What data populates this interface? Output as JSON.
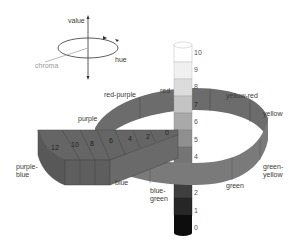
{
  "axes_legend": {
    "value_label": "value",
    "hue_label": "hue",
    "chroma_label": "chroma"
  },
  "hues": [
    {
      "label": "red-purple"
    },
    {
      "label": "red"
    },
    {
      "label": "yellow-red"
    },
    {
      "label": "yellow"
    },
    {
      "label": "green-yellow"
    },
    {
      "label": "green"
    },
    {
      "label": "blue-green"
    },
    {
      "label": "blue"
    },
    {
      "label": "purple-blue"
    },
    {
      "label": "purple"
    }
  ],
  "value_scale": [
    "10",
    "9",
    "8",
    "7",
    "6",
    "5",
    "4",
    "2",
    "1",
    "0"
  ],
  "chroma_scale": [
    "12",
    "10",
    "8",
    "6",
    "4",
    "2",
    "0"
  ],
  "colors": {
    "ring": "#6e6e6e",
    "ring_top": "#7d7d7d",
    "wedge_top": "#656565",
    "wedge_side": "#595959",
    "value_10": "#ffffff",
    "value_9": "#f2f2f2",
    "value_8": "#dcdcdc",
    "value_7": "#c4c4c4",
    "value_6": "#a9a9a9",
    "value_5": "#8f8f8f",
    "value_4": "#757575",
    "value_3": "#5a5a5a",
    "value_2": "#3e3e3e",
    "value_1": "#262626",
    "value_0": "#0d0d0d"
  }
}
